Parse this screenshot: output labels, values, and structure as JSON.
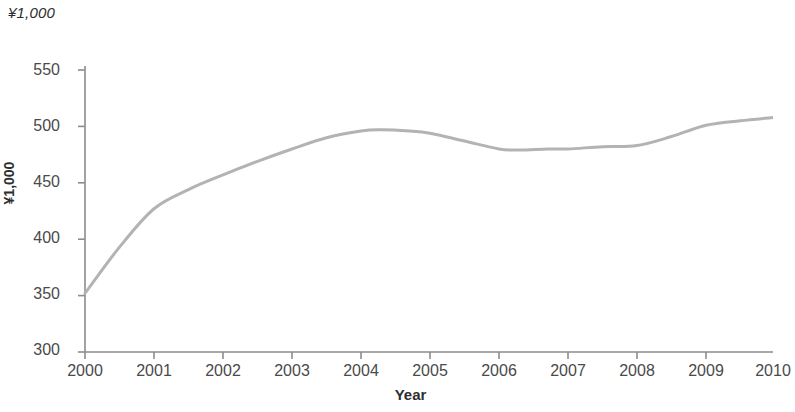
{
  "chart_data": {
    "type": "line",
    "title": "",
    "subtitle": "",
    "unit_note": "¥1,000",
    "xlabel": "Year",
    "ylabel": "¥1,000",
    "x": [
      2000,
      2001,
      2002,
      2003,
      2004,
      2005,
      2006,
      2007,
      2008,
      2009,
      2010
    ],
    "values": [
      352,
      427,
      457,
      480,
      496,
      494,
      480,
      480,
      483,
      501,
      508
    ],
    "detail_points": [
      {
        "x": 2000.0,
        "y": 352
      },
      {
        "x": 2000.5,
        "y": 393
      },
      {
        "x": 2001.0,
        "y": 427
      },
      {
        "x": 2001.5,
        "y": 444
      },
      {
        "x": 2002.0,
        "y": 457
      },
      {
        "x": 2002.5,
        "y": 469
      },
      {
        "x": 2003.0,
        "y": 480
      },
      {
        "x": 2003.5,
        "y": 490
      },
      {
        "x": 2004.0,
        "y": 496
      },
      {
        "x": 2004.3,
        "y": 497
      },
      {
        "x": 2004.7,
        "y": 496
      },
      {
        "x": 2005.0,
        "y": 494
      },
      {
        "x": 2005.5,
        "y": 487
      },
      {
        "x": 2006.0,
        "y": 480
      },
      {
        "x": 2006.3,
        "y": 479
      },
      {
        "x": 2006.7,
        "y": 480
      },
      {
        "x": 2007.0,
        "y": 480
      },
      {
        "x": 2007.5,
        "y": 482
      },
      {
        "x": 2008.0,
        "y": 483
      },
      {
        "x": 2008.5,
        "y": 491
      },
      {
        "x": 2009.0,
        "y": 501
      },
      {
        "x": 2009.5,
        "y": 505
      },
      {
        "x": 2010.0,
        "y": 508
      }
    ],
    "xticks": [
      "2000",
      "2001",
      "2002",
      "2003",
      "2004",
      "2005",
      "2006",
      "2007",
      "2008",
      "2009",
      "2010"
    ],
    "yticks": [
      "300",
      "350",
      "400",
      "450",
      "500",
      "550"
    ],
    "xlim": [
      2000,
      2010
    ],
    "ylim": [
      300,
      550
    ],
    "grid": false,
    "legend": null,
    "series_color": "#b3b3b3",
    "axis_color": "#8c8c8c",
    "background": "#ffffff"
  }
}
